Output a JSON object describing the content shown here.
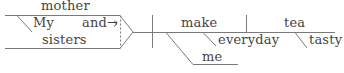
{
  "diagram": {
    "type": "sentence-diagram",
    "sentence_parts": {
      "subject_compound": {
        "top": "mother",
        "modifier": "My",
        "conjunction": "and→",
        "bottom": "sisters"
      },
      "verb": "make",
      "indirect_object": "me",
      "adverb": "everyday",
      "direct_object": "tea",
      "object_modifier": "tasty"
    },
    "colors": {
      "line": "#7a7a7a",
      "text": "#444444",
      "background": "#ffffff"
    }
  }
}
